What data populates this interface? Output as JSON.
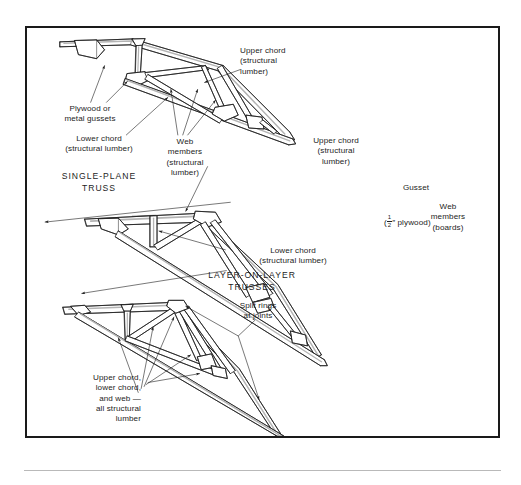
{
  "figure": {
    "type": "technical-line-diagram",
    "border_color": "#1a1a1a",
    "background_color": "#ffffff",
    "line_color": "#1d1d1d",
    "shading_color": "#b4b4b4"
  },
  "sections": [
    {
      "id": "single-plane",
      "label": "SINGLE-PLANE\nTRUSS"
    },
    {
      "id": "layer-on-layer",
      "label": "LAYER-ON-LAYER\nTRUSSES"
    }
  ],
  "callouts": {
    "plywood_gussets": "Plywood or\nmetal gussets",
    "lower_chord_1": "Lower chord\n(structural lumber)",
    "web_members_1": "Web\nmembers\n(structural\nlumber)",
    "upper_chord_1": "Upper chord\n(structural\nlumber)",
    "upper_chord_2": "Upper chord\n(structural\nlumber)",
    "lower_chord_2": "Lower chord\n(structural lumber)",
    "gusset_title": "Gusset",
    "gusset_spec_prefix": "(",
    "gusset_spec_numerator": "1",
    "gusset_spec_denominator": "2",
    "gusset_spec_suffix": "″ plywood)",
    "web_members_2": "Web\nmembers\n(boards)",
    "split_rings": "Split rings\nat joints",
    "all_structural": "Upper chord,\nlower chord,\nand web —\nall structural\nlumber"
  }
}
